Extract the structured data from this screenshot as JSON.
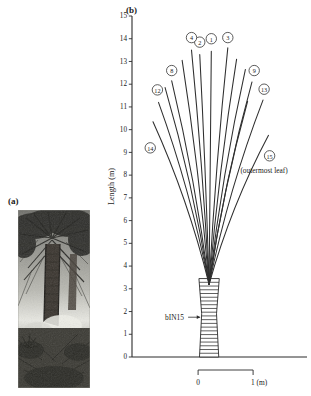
{
  "figure": {
    "panel_a": {
      "label": "(a)",
      "image_name": "palm-tree-photograph",
      "description": "black and white photograph of a palm tree stand"
    },
    "panel_b": {
      "label": "(b)",
      "y_axis": {
        "title": "Length (m)",
        "ticks": [
          "0",
          "1",
          "2",
          "3",
          "4",
          "5",
          "6",
          "7",
          "8",
          "9",
          "10",
          "11",
          "12",
          "13",
          "14",
          "15"
        ],
        "min": 0,
        "max": 15
      },
      "trunk_annotation": {
        "label": "bIN15"
      },
      "outermost_note": "(outermost leaf)",
      "scale_bar": {
        "start_label": "0",
        "end_label": "1 (m)"
      }
    }
  },
  "chart_data": {
    "type": "line",
    "title": "",
    "xlabel": "",
    "ylabel": "Length (m)",
    "ylim": [
      0,
      15
    ],
    "xlim": [
      -1.35,
      1.35
    ],
    "grid": false,
    "legend": "none",
    "crown_base_x": 0.02,
    "crown_base_y": 3.2,
    "annotations": [
      {
        "text": "bIN15",
        "x": -0.78,
        "y": 1.75
      },
      {
        "text": "(outermost leaf)",
        "x": 1.02,
        "y": 8.2
      }
    ],
    "series": [
      {
        "name": "leaf-1",
        "label": "1",
        "tip_x": 0.06,
        "tip_y": 13.45,
        "label_x": 0.06,
        "label_y": 14.0
      },
      {
        "name": "leaf-2",
        "label": "2",
        "tip_x": -0.15,
        "tip_y": 13.3,
        "label_x": -0.15,
        "label_y": 13.85
      },
      {
        "name": "leaf-3",
        "label": "3",
        "tip_x": 0.36,
        "tip_y": 13.6,
        "label_x": 0.36,
        "label_y": 14.05
      },
      {
        "name": "leaf-4",
        "label": "4",
        "tip_x": -0.3,
        "tip_y": 13.5,
        "label_x": -0.3,
        "label_y": 14.05
      },
      {
        "name": "leaf-5",
        "label": "",
        "tip_x": -0.47,
        "tip_y": 13.05,
        "label_x": null,
        "label_y": null
      },
      {
        "name": "leaf-6",
        "label": "",
        "tip_x": 0.52,
        "tip_y": 13.1,
        "label_x": null,
        "label_y": null
      },
      {
        "name": "leaf-7",
        "label": "",
        "tip_x": 0.68,
        "tip_y": 12.65,
        "label_x": null,
        "label_y": null
      },
      {
        "name": "leaf-8",
        "label": "8",
        "tip_x": -0.66,
        "tip_y": 12.15,
        "label_x": -0.66,
        "label_y": 12.6
      },
      {
        "name": "leaf-9",
        "label": "9",
        "tip_x": 0.8,
        "tip_y": 12.1,
        "label_x": 0.84,
        "label_y": 12.6
      },
      {
        "name": "leaf-10",
        "label": "",
        "tip_x": -0.78,
        "tip_y": 11.85,
        "label_x": null,
        "label_y": null
      },
      {
        "name": "leaf-11",
        "label": "",
        "tip_x": 0.72,
        "tip_y": 11.25,
        "label_x": null,
        "label_y": null
      },
      {
        "name": "leaf-12",
        "label": "12",
        "tip_x": -0.9,
        "tip_y": 11.2,
        "label_x": -0.92,
        "label_y": 11.75
      },
      {
        "name": "leaf-13",
        "label": "13",
        "tip_x": 1.0,
        "tip_y": 11.3,
        "label_x": 1.02,
        "label_y": 11.78
      },
      {
        "name": "leaf-14",
        "label": "14",
        "tip_x": -1.0,
        "tip_y": 10.35,
        "label_x": -1.05,
        "label_y": 9.2
      },
      {
        "name": "leaf-15",
        "label": "15",
        "tip_x": 1.1,
        "tip_y": 9.75,
        "label_x": 1.12,
        "label_y": 8.85
      }
    ],
    "trunk": {
      "base_half_width": 0.175,
      "waist_half_width": 0.135,
      "top_half_width": 0.185,
      "top_y": 3.45,
      "scar_count": 21
    }
  }
}
